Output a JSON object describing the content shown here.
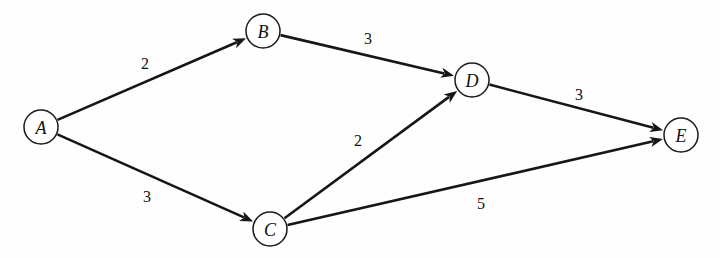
{
  "diagram": {
    "type": "directed-weighted-graph",
    "width": 720,
    "height": 258,
    "background_color": "#fefefe",
    "stroke_color": "#161616",
    "node_fill_color": "#ffffff",
    "node_radius": 17
  },
  "nodes": [
    {
      "id": "A",
      "label": "A",
      "cx": 41,
      "cy": 127,
      "r": 17
    },
    {
      "id": "B",
      "label": "B",
      "cx": 263,
      "cy": 31,
      "r": 17
    },
    {
      "id": "C",
      "label": "C",
      "cx": 270,
      "cy": 229,
      "r": 17
    },
    {
      "id": "D",
      "label": "D",
      "cx": 472,
      "cy": 80,
      "r": 17
    },
    {
      "id": "E",
      "label": "E",
      "cx": 681,
      "cy": 135,
      "r": 17
    }
  ],
  "edges": [
    {
      "id": "A-B",
      "from": "A",
      "to": "B",
      "weight": "2",
      "label_x": 145,
      "label_y": 63,
      "directed": true
    },
    {
      "id": "A-C",
      "from": "A",
      "to": "C",
      "weight": "3",
      "label_x": 147,
      "label_y": 196,
      "directed": true
    },
    {
      "id": "B-D",
      "from": "B",
      "to": "D",
      "weight": "3",
      "label_x": 368,
      "label_y": 38,
      "directed": true
    },
    {
      "id": "C-D",
      "from": "C",
      "to": "D",
      "weight": "2",
      "label_x": 358,
      "label_y": 140,
      "directed": true
    },
    {
      "id": "D-E",
      "from": "D",
      "to": "E",
      "weight": "3",
      "label_x": 579,
      "label_y": 94,
      "directed": true
    },
    {
      "id": "C-E",
      "from": "C",
      "to": "E",
      "weight": "5",
      "label_x": 481,
      "label_y": 203,
      "directed": true
    }
  ]
}
